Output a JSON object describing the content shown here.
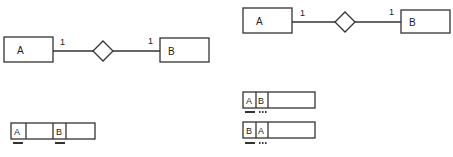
{
  "diagrams": {
    "left_er": {
      "entity_a": "A",
      "entity_b": "B",
      "cardinality_a": "1",
      "cardinality_b": "1"
    },
    "right_er": {
      "entity_a": "A",
      "entity_b": "B",
      "cardinality_a": "1",
      "cardinality_b": "1"
    },
    "left_table": {
      "cells": [
        "A",
        "",
        "B",
        ""
      ],
      "keys": [
        "primary",
        "none",
        "primary",
        "none"
      ]
    },
    "right_tables": [
      {
        "cells": [
          "A",
          "B",
          ""
        ],
        "keys": [
          "primary",
          "foreign-dotted",
          "none"
        ]
      },
      {
        "cells": [
          "B",
          "A",
          ""
        ],
        "keys": [
          "primary",
          "foreign-dotted",
          "none"
        ]
      }
    ]
  },
  "colors": {
    "stroke": "#333333",
    "background": "#ffffff"
  }
}
